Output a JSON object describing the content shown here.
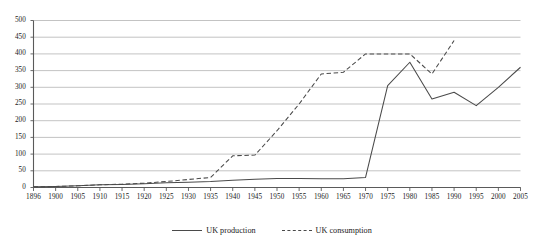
{
  "chart_data": {
    "type": "line",
    "title": "",
    "xlabel": "",
    "ylabel": "",
    "xlim": [
      1896,
      2005
    ],
    "ylim": [
      0,
      500
    ],
    "ytick_values": [
      0,
      50,
      100,
      150,
      200,
      250,
      300,
      350,
      400,
      450,
      500
    ],
    "ytick_labels": [
      "0",
      "50",
      "100",
      "150",
      "200",
      "250",
      "300",
      "350",
      "400",
      "450",
      "500"
    ],
    "xtick_labels": [
      "1896",
      "1900",
      "1905",
      "1910",
      "1915",
      "1920",
      "1925",
      "1930",
      "1935",
      "1940",
      "1945",
      "1950",
      "1955",
      "1960",
      "1965",
      "1970",
      "1975",
      "1980",
      "1985",
      "1990",
      "1995",
      "2000",
      "2005"
    ],
    "x": [
      1896,
      1900,
      1905,
      1910,
      1915,
      1920,
      1925,
      1930,
      1935,
      1940,
      1945,
      1950,
      1955,
      1960,
      1965,
      1970,
      1975,
      1980,
      1985,
      1990,
      1995,
      2000,
      2005
    ],
    "grid": true,
    "legend_position": "bottom-center",
    "series": [
      {
        "name": "UK production",
        "style": "solid",
        "color": "#4a4a4a",
        "values": [
          2,
          3,
          5,
          8,
          9,
          11,
          14,
          16,
          18,
          22,
          25,
          27,
          27,
          26,
          26,
          30,
          305,
          375,
          265,
          285,
          245,
          300,
          360
        ]
      },
      {
        "name": "UK consumption",
        "style": "dashed",
        "color": "#4a4a4a",
        "values": [
          2,
          3,
          5,
          8,
          10,
          13,
          18,
          24,
          30,
          95,
          97,
          170,
          250,
          340,
          345,
          400,
          400,
          400,
          340,
          440,
          null,
          null,
          null
        ]
      }
    ]
  },
  "legend": {
    "entries": [
      {
        "label": "UK production",
        "style": "solid"
      },
      {
        "label": "UK consumption",
        "style": "dashed"
      }
    ]
  }
}
